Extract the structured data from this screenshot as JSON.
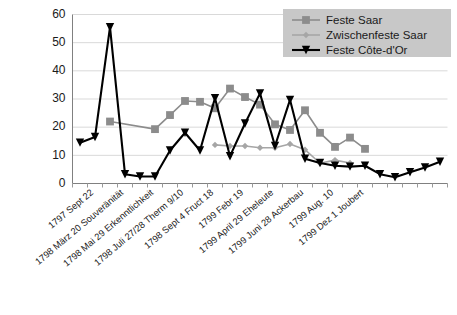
{
  "chart_data": {
    "type": "line",
    "title": "",
    "xlabel": "",
    "ylabel": "",
    "ylim": [
      0,
      60
    ],
    "ytick_values": [
      0,
      10,
      20,
      30,
      40,
      50,
      60
    ],
    "grid": true,
    "legend_position": "top-right",
    "categories": [
      "1797 Sept 22",
      "",
      "1798 März 20 Souveränität",
      "",
      "1798 Mai 29 Erkenntlichkeit",
      "",
      "1798 Juli 27/28 Therm 9/10",
      "",
      "1798 Sept 4 Fruct 18",
      "",
      "1799 Febr 19",
      "",
      "1799 April 29 Eheleute",
      "",
      "1799 Juni 28 Ackerbau",
      "",
      "1799 Aug. 10",
      "",
      "1799 Dez 1 Joubert",
      ""
    ],
    "xtick_labels": [
      "1797 Sept 22",
      "1798 März 20 Souveränität",
      "1798 Mai 29 Erkenntlichkeit",
      "1798 Juli 27/28 Therm 9/10",
      "1798 Sept 4 Fruct 18",
      "1799 Febr 19",
      "1799 April 29 Eheleute",
      "1799 Juni 28 Ackerbau",
      "1799 Aug. 10",
      "1799 Dez 1 Joubert"
    ],
    "series": [
      {
        "name": "Feste Saar",
        "color": "#8c8c8c",
        "marker": "square",
        "points": [
          {
            "x": 2,
            "y": 22.0
          },
          {
            "x": 5,
            "y": 19.3
          },
          {
            "x": 6,
            "y": 24.3
          },
          {
            "x": 7,
            "y": 29.3
          },
          {
            "x": 8,
            "y": 29.0
          },
          {
            "x": 9,
            "y": 26.7
          },
          {
            "x": 10,
            "y": 33.7
          },
          {
            "x": 11,
            "y": 30.7
          },
          {
            "x": 12,
            "y": 28.0
          },
          {
            "x": 13,
            "y": 21.0
          },
          {
            "x": 14,
            "y": 19.0
          },
          {
            "x": 15,
            "y": 26.0
          },
          {
            "x": 16,
            "y": 18.0
          },
          {
            "x": 17,
            "y": 13.0
          },
          {
            "x": 18,
            "y": 16.3
          },
          {
            "x": 19,
            "y": 12.3
          }
        ]
      },
      {
        "name": "Zwischenfeste Saar",
        "color": "#a6a6a6",
        "marker": "diamond",
        "points": [
          {
            "x": 9,
            "y": 13.7
          },
          {
            "x": 10,
            "y": 13.3
          },
          {
            "x": 11,
            "y": 13.3
          },
          {
            "x": 12,
            "y": 12.7
          },
          {
            "x": 13,
            "y": 12.7
          },
          {
            "x": 14,
            "y": 14.0
          },
          {
            "x": 15,
            "y": 12.0
          },
          {
            "x": 16,
            "y": 7.2
          },
          {
            "x": 17,
            "y": 8.3
          },
          {
            "x": 18,
            "y": 7.3
          }
        ]
      },
      {
        "name": "Feste Côte-d'Or",
        "color": "#000000",
        "marker": "triangle-down",
        "points": [
          {
            "x": 0,
            "y": 14.5
          },
          {
            "x": 1,
            "y": 16.5
          },
          {
            "x": 2,
            "y": 55.5
          },
          {
            "x": 3,
            "y": 3.3
          },
          {
            "x": 4,
            "y": 2.5
          },
          {
            "x": 5,
            "y": 2.5
          },
          {
            "x": 6,
            "y": 11.7
          },
          {
            "x": 7,
            "y": 18.0
          },
          {
            "x": 8,
            "y": 11.7
          },
          {
            "x": 9,
            "y": 30.3
          },
          {
            "x": 10,
            "y": 9.7
          },
          {
            "x": 11,
            "y": 21.3
          },
          {
            "x": 12,
            "y": 32.0
          },
          {
            "x": 13,
            "y": 13.3
          },
          {
            "x": 14,
            "y": 29.7
          },
          {
            "x": 15,
            "y": 8.8
          },
          {
            "x": 16,
            "y": 7.3
          },
          {
            "x": 17,
            "y": 6.3
          },
          {
            "x": 18,
            "y": 6.0
          },
          {
            "x": 19,
            "y": 6.3
          },
          {
            "x": 20,
            "y": 3.3
          },
          {
            "x": 21,
            "y": 2.2
          },
          {
            "x": 22,
            "y": 4.0
          },
          {
            "x": 23,
            "y": 5.7
          },
          {
            "x": 24,
            "y": 7.7
          }
        ]
      }
    ],
    "legend": [
      {
        "label": "Feste Saar",
        "color": "#8c8c8c",
        "marker": "square"
      },
      {
        "label": "Zwischenfeste Saar",
        "color": "#a6a6a6",
        "marker": "diamond"
      },
      {
        "label": "Feste Côte-d'Or",
        "color": "#000000",
        "marker": "triangle-down"
      }
    ]
  },
  "axis": {
    "y_labels": [
      "60",
      "50",
      "40",
      "30",
      "20",
      "10",
      "0"
    ]
  },
  "legend": {
    "item_0_label": "Feste Saar",
    "item_1_label": "Zwischenfeste Saar",
    "item_2_label": "Feste Côte-d'Or"
  },
  "xlabels": {
    "l0": "1797 Sept 22",
    "l1": "1798 März 20 Souveränität",
    "l2": "1798 Mai 29 Erkenntlichkeit",
    "l3": "1798 Juli 27/28 Therm 9/10",
    "l4": "1798 Sept 4 Fruct 18",
    "l5": "1799 Febr 19",
    "l6": "1799 April 29 Eheleute",
    "l7": "1799 Juni 28 Ackerbau",
    "l8": "1799 Aug. 10",
    "l9": "1799 Dez 1 Joubert"
  }
}
